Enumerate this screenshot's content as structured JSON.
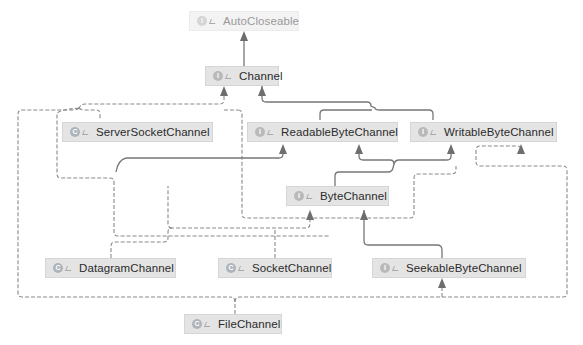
{
  "diagram": {
    "type": "class-hierarchy",
    "colors": {
      "background": "#ffffff",
      "node_fill": "#e4e4e4",
      "node_fill_faded": "#f3f3f3",
      "edge_solid": "#7a7a7a",
      "edge_dashed": "#8a8a8a",
      "text": "#2b2b2b",
      "text_faded": "#9a9a9a"
    },
    "nodes": [
      {
        "id": "autocloseable",
        "label": "AutoCloseable",
        "kind": "interface",
        "kind_glyph": "I",
        "faded": true
      },
      {
        "id": "channel",
        "label": "Channel",
        "kind": "interface",
        "kind_glyph": "I",
        "faded": false
      },
      {
        "id": "serversocketchannel",
        "label": "ServerSocketChannel",
        "kind": "class",
        "kind_glyph": "C",
        "faded": false
      },
      {
        "id": "readablebytechannel",
        "label": "ReadableByteChannel",
        "kind": "interface",
        "kind_glyph": "I",
        "faded": false
      },
      {
        "id": "writablebytechannel",
        "label": "WritableByteChannel",
        "kind": "interface",
        "kind_glyph": "I",
        "faded": false
      },
      {
        "id": "bytechannel",
        "label": "ByteChannel",
        "kind": "interface",
        "kind_glyph": "I",
        "faded": false
      },
      {
        "id": "datagramchannel",
        "label": "DatagramChannel",
        "kind": "class",
        "kind_glyph": "C",
        "faded": false
      },
      {
        "id": "socketchannel",
        "label": "SocketChannel",
        "kind": "class",
        "kind_glyph": "C",
        "faded": false
      },
      {
        "id": "seekablebytechannel",
        "label": "SeekableByteChannel",
        "kind": "interface",
        "kind_glyph": "I",
        "faded": false
      },
      {
        "id": "filechannel",
        "label": "FileChannel",
        "kind": "class",
        "kind_glyph": "C",
        "faded": false
      }
    ],
    "edges": [
      {
        "from": "channel",
        "to": "autocloseable",
        "style": "solid",
        "relation": "extends"
      },
      {
        "from": "readablebytechannel",
        "to": "channel",
        "style": "solid",
        "relation": "extends"
      },
      {
        "from": "writablebytechannel",
        "to": "channel",
        "style": "solid",
        "relation": "extends"
      },
      {
        "from": "bytechannel",
        "to": "readablebytechannel",
        "style": "solid",
        "relation": "extends"
      },
      {
        "from": "bytechannel",
        "to": "writablebytechannel",
        "style": "solid",
        "relation": "extends"
      },
      {
        "from": "seekablebytechannel",
        "to": "bytechannel",
        "style": "solid",
        "relation": "extends"
      },
      {
        "from": "serversocketchannel",
        "to": "channel",
        "style": "dashed",
        "relation": "implements"
      },
      {
        "from": "datagramchannel",
        "to": "channel",
        "style": "dashed",
        "relation": "implements"
      },
      {
        "from": "datagramchannel",
        "to": "bytechannel",
        "style": "dashed",
        "relation": "implements"
      },
      {
        "from": "socketchannel",
        "to": "channel",
        "style": "dashed",
        "relation": "implements"
      },
      {
        "from": "socketchannel",
        "to": "bytechannel",
        "style": "dashed",
        "relation": "implements"
      },
      {
        "from": "filechannel",
        "to": "seekablebytechannel",
        "style": "dashed",
        "relation": "implements"
      },
      {
        "from": "filechannel",
        "to": "readablebytechannel",
        "style": "dashed",
        "relation": "implements"
      },
      {
        "from": "filechannel",
        "to": "writablebytechannel",
        "style": "dashed",
        "relation": "implements"
      },
      {
        "from": "filechannel",
        "to": "channel",
        "style": "dashed",
        "relation": "implements"
      }
    ]
  }
}
